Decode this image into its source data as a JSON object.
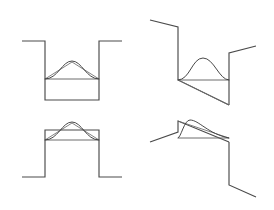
{
  "figure": {
    "width": 274,
    "height": 210,
    "background_color": "#ffffff",
    "stroke_color_profile": "#4a4a4a",
    "stroke_color_envelope": "#6b6b6b",
    "stroke_color_bump": "#3f3f3f",
    "panel_count": 4,
    "panels": [
      {
        "id": "panel-top-left",
        "label": "Flat notch-down step with centered bump",
        "position": "top-left",
        "profile_polyline": "22,41 45,41 45,100 99,100 99,41 122,41",
        "baseline": "45,79 99,79",
        "envelope_polyline": "45,79 72,62 99,79",
        "bump_curve": "M45,79 C58,79 62,61 72,61 C82,61 86,79 99,79",
        "step_direction": "down",
        "bump_peak_x": 72,
        "bump_peak_y": 61
      },
      {
        "id": "panel-top-right",
        "label": "Descending sloped step with offset bump",
        "position": "top-right",
        "profile_polyline": "150,20 178,27 178,80 229,105",
        "profile_polyline_right": "229,105 229,53 256,46",
        "baseline": "178,80 229,80",
        "envelope_polyline": "178,80 229,105",
        "bump_curve": "M178,80 C190,80 192,58 203,58 C214,58 219,80 229,80",
        "step_direction": "down-slope",
        "bump_peak_x": 203,
        "bump_peak_y": 58
      },
      {
        "id": "panel-bottom-left",
        "label": "Flat plateau-up step with centered bump",
        "position": "bottom-left",
        "profile_polyline": "22,177 45,177 45,130 99,130 99,177 122,177",
        "baseline": "45,140 99,140",
        "envelope_polyline": "45,140 72,123 99,140",
        "bump_curve": "M45,140 C58,140 62,122 72,122 C82,122 86,140 99,140",
        "step_direction": "up",
        "bump_peak_x": 72,
        "bump_peak_y": 122
      },
      {
        "id": "panel-bottom-right",
        "label": "Ascending sloped step with leading-edge bump",
        "position": "bottom-right",
        "profile_polyline": "150,142 178,132 178,121 229,142",
        "profile_polyline_right": "229,142 229,185 256,197",
        "baseline": "178,138 229,138",
        "envelope_polyline": "178,121 229,138",
        "bump_curve": "M178,138 C181,138 184,120 190,120 C199,120 208,134 229,138",
        "step_direction": "up-slope",
        "bump_peak_x": 190,
        "bump_peak_y": 120
      }
    ]
  }
}
